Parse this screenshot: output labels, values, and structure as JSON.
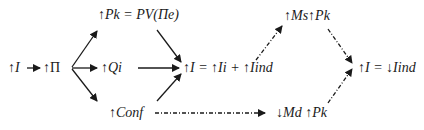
{
  "nodes": {
    "i": "↑I",
    "pi": "↑Π",
    "pk": "↑Pk = PV(Πe)",
    "qi": "↑Qi",
    "conf": "↑Conf",
    "i_sum": "↑I = ↑Ii + ↑Iind",
    "ms_pk": "↑Ms↑Pk",
    "md_pk": "↓Md ↑Pk",
    "i_result": "↑I = ↓Iind"
  },
  "edges": [
    {
      "from": "i",
      "to": "pi",
      "style": "solid"
    },
    {
      "from": "pi",
      "to": "pk",
      "style": "solid"
    },
    {
      "from": "pi",
      "to": "qi",
      "style": "solid"
    },
    {
      "from": "pi",
      "to": "conf",
      "style": "solid"
    },
    {
      "from": "pk",
      "to": "i_sum",
      "style": "solid"
    },
    {
      "from": "qi",
      "to": "i_sum",
      "style": "solid"
    },
    {
      "from": "conf",
      "to": "i_sum",
      "style": "solid"
    },
    {
      "from": "i_sum",
      "to": "ms_pk",
      "style": "dash-dot"
    },
    {
      "from": "conf",
      "to": "md_pk",
      "style": "dash-dot"
    },
    {
      "from": "ms_pk",
      "to": "i_result",
      "style": "dash-dot"
    },
    {
      "from": "md_pk",
      "to": "i_result",
      "style": "dash-dot"
    }
  ],
  "colors": {
    "ink": "#1a1a1a",
    "background": "#ffffff"
  }
}
